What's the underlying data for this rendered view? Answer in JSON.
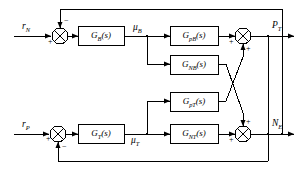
{
  "diagram": {
    "type": "control-block-diagram",
    "title": "",
    "width": 302,
    "height": 170,
    "line_color": "#000000",
    "block_fill": "#ffffff"
  },
  "inputs": [
    {
      "id": "rN",
      "label_base": "r",
      "label_sub": "N",
      "x": 22,
      "y": 28
    },
    {
      "id": "rP",
      "label_base": "r",
      "label_sub": "P",
      "x": 22,
      "y": 126
    }
  ],
  "outputs": [
    {
      "id": "PT",
      "label_base": "P",
      "label_sub": "T",
      "x": 272,
      "y": 22
    },
    {
      "id": "NE",
      "label_base": "N",
      "label_sub": "E",
      "x": 272,
      "y": 120
    }
  ],
  "signals": [
    {
      "id": "muB",
      "label_base": "μ",
      "label_sub": "B",
      "x": 133,
      "y": 24
    },
    {
      "id": "muT",
      "label_base": "μ",
      "label_sub": "T",
      "x": 131,
      "y": 136
    }
  ],
  "blocks": [
    {
      "id": "GB",
      "base": "G",
      "sub": "B",
      "tail": "(s)",
      "x": 78,
      "y": 26,
      "w": 46,
      "h": 19
    },
    {
      "id": "GT",
      "base": "G",
      "sub": "T",
      "tail": "(s)",
      "x": 78,
      "y": 124,
      "w": 46,
      "h": 19
    },
    {
      "id": "GpB",
      "base": "G",
      "sub": "pB",
      "tail": "(s)",
      "x": 170,
      "y": 26,
      "w": 48,
      "h": 19
    },
    {
      "id": "GNB",
      "base": "G",
      "sub": "NB",
      "tail": "(s)",
      "x": 170,
      "y": 55,
      "w": 48,
      "h": 19
    },
    {
      "id": "GpT",
      "base": "G",
      "sub": "pT",
      "tail": "(s)",
      "x": 170,
      "y": 92,
      "w": 48,
      "h": 19
    },
    {
      "id": "GNT",
      "base": "G",
      "sub": "NT",
      "tail": "(s)",
      "x": 170,
      "y": 124,
      "w": 48,
      "h": 19
    }
  ],
  "summing_junctions": [
    {
      "id": "sum-rN",
      "cx": 60,
      "cy": 36,
      "r": 8,
      "signs": [
        {
          "text": "+",
          "x": 49,
          "y": 41
        },
        {
          "text": "−",
          "x": 63,
          "y": 20
        }
      ]
    },
    {
      "id": "sum-rP",
      "cx": 58,
      "cy": 134,
      "r": 8,
      "signs": [
        {
          "text": "+",
          "x": 47,
          "y": 137
        },
        {
          "text": "−",
          "x": 61,
          "y": 145
        }
      ]
    },
    {
      "id": "sum-PT",
      "cx": 243,
      "cy": 36,
      "r": 8,
      "signs": [
        {
          "text": "+",
          "x": 231,
          "y": 40
        },
        {
          "text": "+",
          "x": 247,
          "y": 47
        }
      ]
    },
    {
      "id": "sum-NE",
      "cx": 243,
      "cy": 134,
      "r": 8,
      "signs": [
        {
          "text": "+",
          "x": 231,
          "y": 138
        },
        {
          "text": "+",
          "x": 247,
          "y": 121
        }
      ]
    }
  ]
}
